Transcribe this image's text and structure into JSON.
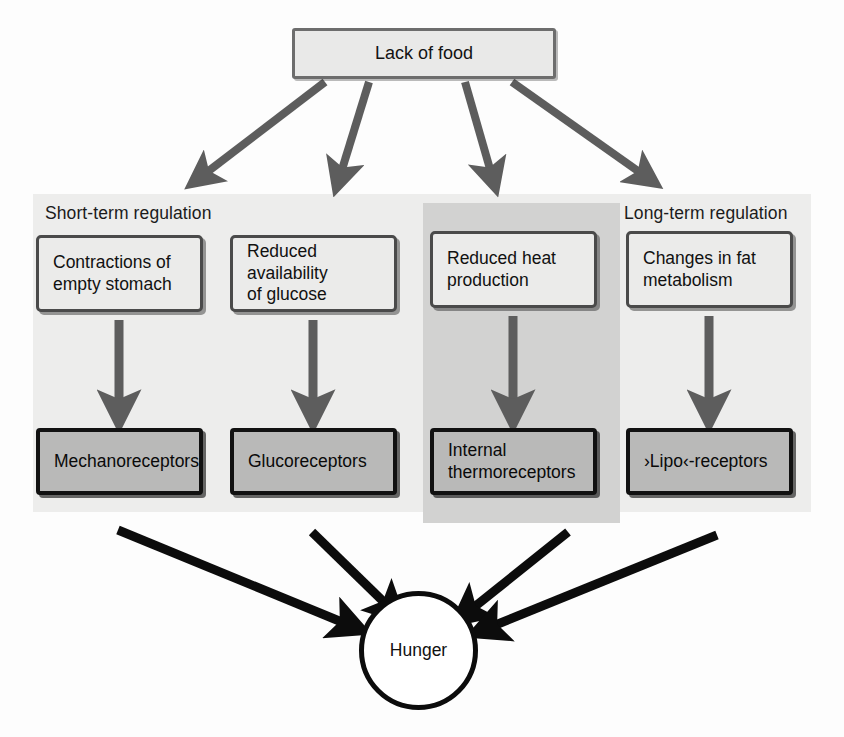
{
  "figure": {
    "source_node": {
      "id": "lack-of-food",
      "label": "Lack of food"
    },
    "panels": [
      {
        "id": "short-term",
        "label": "Short-term regulation",
        "shade": "#ededec"
      },
      {
        "id": "long-term",
        "label": "Long-term regulation",
        "shade": "#d2d2d1"
      }
    ],
    "causes": [
      {
        "id": "contractions",
        "label": "Contractions of\nempty stomach",
        "panel": "short-term"
      },
      {
        "id": "glucose",
        "label": "Reduced availability\nof glucose",
        "panel": "short-term"
      },
      {
        "id": "heat",
        "label": "Reduced heat\nproduction",
        "panel": "long-term"
      },
      {
        "id": "fat",
        "label": "Changes in fat\nmetabolism",
        "panel": "long-term"
      }
    ],
    "receptors": [
      {
        "id": "mechanoreceptors",
        "label": "Mechanoreceptors"
      },
      {
        "id": "glucoreceptors",
        "label": "Glucoreceptors"
      },
      {
        "id": "thermoreceptors",
        "label": "Internal\nthermoreceptors"
      },
      {
        "id": "liporeceptors",
        "label": "›Lipo‹-receptors"
      }
    ],
    "outcome_node": {
      "id": "hunger",
      "label": "Hunger"
    },
    "colors": {
      "panel_light": "#ededec",
      "panel_dark": "#d2d2d1",
      "cause_box_fill": "#ebebea",
      "cause_box_border": "#4a4a4a",
      "receptor_box_fill": "#b9b9b8",
      "receptor_box_border": "#111111",
      "top_arrow": "#5d5d5d",
      "mid_arrow": "#5d5d5d",
      "bottom_arrow": "#0c0c0c",
      "text": "#111111",
      "background": "#fdfdfd"
    },
    "arrow_counts": {
      "from_source": 4,
      "cause_to_receptor": 4,
      "receptor_to_hunger": 4
    }
  }
}
